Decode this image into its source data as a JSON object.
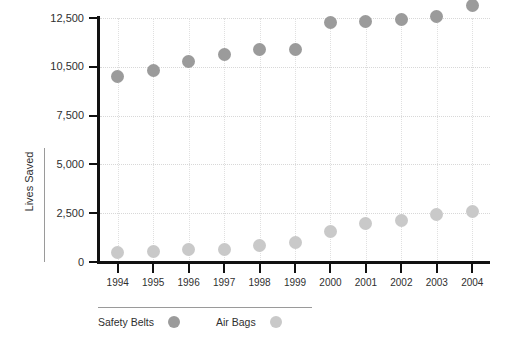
{
  "chart_data": {
    "type": "scatter",
    "title": "",
    "xlabel": "",
    "ylabel": "Lives Saved",
    "grid": true,
    "legend_position": "bottom-left",
    "categories": [
      "1994",
      "1995",
      "1996",
      "1997",
      "1998",
      "1999",
      "2000",
      "2001",
      "2002",
      "2003",
      "2004"
    ],
    "x": [
      1994,
      1995,
      1996,
      1997,
      1998,
      1999,
      2000,
      2001,
      2002,
      2003,
      2004
    ],
    "yticks": [
      0,
      2500,
      5000,
      7500,
      10500,
      12500
    ],
    "ytick_labels": [
      "0",
      "2,500",
      "5,000",
      "7,500",
      "10,500",
      "12,500"
    ],
    "ylim": [
      0,
      13200
    ],
    "y_axis_note": "irregular tick spacing: equal pixel pitch between 0, 2,500, 5,000, 7,500, 10,500, 12,500",
    "series": [
      {
        "name": "Safety Belts",
        "color": "#9b9b9b",
        "values": [
          9900,
          10300,
          10700,
          11000,
          11200,
          11200,
          12300,
          12350,
          12450,
          12550,
          13000
        ]
      },
      {
        "name": "Air Bags",
        "color": "#c9c9c9",
        "values": [
          500,
          520,
          640,
          650,
          840,
          1020,
          1580,
          1960,
          2140,
          2440,
          2600
        ]
      }
    ]
  },
  "legend": {
    "items": [
      {
        "label": "Safety Belts",
        "color": "#9b9b9b"
      },
      {
        "label": "Air Bags",
        "color": "#c9c9c9"
      }
    ]
  },
  "axis": {
    "y_title": "Lives Saved"
  }
}
